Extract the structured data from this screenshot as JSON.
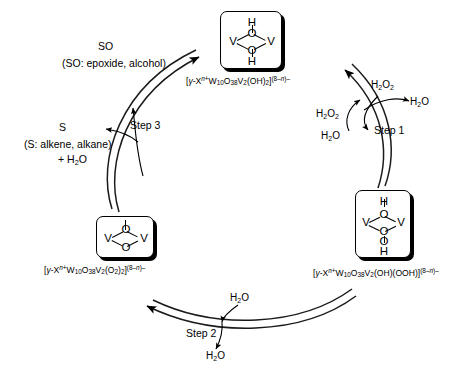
{
  "diagram": {
    "type": "catalytic-cycle",
    "direction": "clockwise"
  },
  "species": {
    "top": {
      "id": "dihydroxo",
      "formula_parts": {
        "open": "[",
        "gamma": "γ",
        "dash": "-X",
        "n_charge": "n+",
        "w": "W",
        "w_sub": "10",
        "o": "O",
        "o_sub": "38",
        "v": "V",
        "v_sub": "2",
        "ligand": "(OH)",
        "ligand_sub": "2",
        "close": "]",
        "charge": "(8–n)–"
      },
      "formula_plain": "[γ-X n+ W10O38V2(OH)2](8–n)–",
      "structure": {
        "atoms": [
          "H",
          "O",
          "V",
          "V",
          "O",
          "H"
        ],
        "layout": "H over O, V–O–V bridge, O under, H bottom"
      }
    },
    "bottom_right": {
      "id": "hydroxo-hydroperoxo",
      "formula_parts": {
        "open": "[",
        "gamma": "γ",
        "dash": "-X",
        "n_charge": "n+",
        "w": "W",
        "w_sub": "10",
        "o": "O",
        "o_sub": "38",
        "v": "V",
        "v_sub": "2",
        "ligand": "(OH)(OOH)",
        "close": "]",
        "charge": "(8–n)–"
      },
      "formula_plain": "[γ-X n+ W10O38V2(OH)(OOH)](8–n)–",
      "structure": {
        "atoms": [
          "H",
          "O",
          "V",
          "V",
          "O",
          "O",
          "H"
        ],
        "layout": "H top, V–O–V bridge, O–O–H chain below"
      }
    },
    "bottom_left": {
      "id": "diperoxo",
      "formula_parts": {
        "open": "[",
        "gamma": "γ",
        "dash": "-X",
        "n_charge": "n+",
        "w": "W",
        "w_sub": "10",
        "o": "O",
        "o_sub": "38",
        "v": "V",
        "v_sub": "2",
        "ligand": "(O",
        "ligand_sub1": "2",
        "ligand2": ")",
        "ligand_sub2": "2",
        "close": "]",
        "charge": "(8–n)–"
      },
      "formula_plain": "[γ-X n+ W10O38V2(O2)2](8–n)–",
      "structure": {
        "atoms": [
          "O",
          "V",
          "V",
          "O"
        ],
        "layout": "V–O–V with O above and O below bridge"
      }
    }
  },
  "steps": {
    "step1": {
      "label": "Step 1",
      "inputs": [
        "H₂O₂",
        "H₂O₂"
      ],
      "outputs": [
        "H₂O",
        "H₂O"
      ],
      "input_1_formula": "H",
      "input_1_sub": "2",
      "input_1_tail": "O",
      "input_1_tail_sub": "2"
    },
    "step2": {
      "label": "Step 2",
      "inputs": [
        "H₂O"
      ],
      "outputs": [
        "H₂O"
      ]
    },
    "step3": {
      "label": "Step 3",
      "substrate_symbol": "S",
      "substrate_note": "(S: alkene, alkane)",
      "substrate_extra": "+ H₂O",
      "product_symbol": "SO",
      "product_note": "(SO: epoxide, alcohol)"
    }
  },
  "reagents": {
    "h2o2": {
      "main": "H",
      "sub": "2",
      "mid": "O",
      "sub2": "2"
    },
    "h2o": {
      "main": "H",
      "sub": "2",
      "mid": "O"
    }
  },
  "colors": {
    "stroke": "#000000",
    "background": "#ffffff",
    "text": "#000000"
  }
}
